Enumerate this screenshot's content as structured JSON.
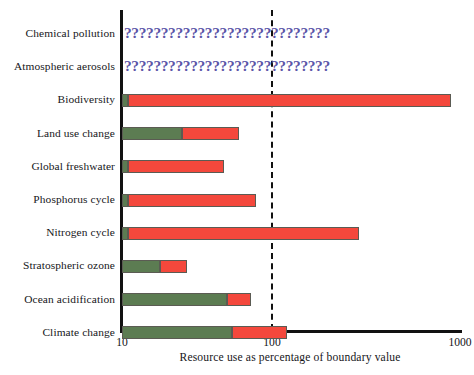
{
  "chart_data": {
    "type": "bar",
    "orientation": "horizontal",
    "title": "",
    "xlabel": "Resource use as percentage of boundary value",
    "ylabel": "",
    "xscale": "log",
    "xlim": [
      10,
      1000
    ],
    "xticks": [
      10,
      100,
      1000
    ],
    "xticklabels": [
      "10",
      "100",
      "1000"
    ],
    "grid": false,
    "legend": false,
    "boundary_line": {
      "value": 100,
      "style": "dashed",
      "color": "#111111",
      "label": ""
    },
    "categories": [
      "Chemical pollution",
      "Atmospheric aerosols",
      "Biodiversity",
      "Land use change",
      "Global freshwater",
      "Phosphorus cycle",
      "Nitrogen cycle",
      "Stratospheric ozone",
      "Ocean acidification",
      "Climate change"
    ],
    "series": [
      {
        "name": "Within boundary (green)",
        "color": "#5c7c52",
        "values": [
          null,
          null,
          11,
          25,
          11,
          11,
          11,
          18,
          50,
          54
        ]
      },
      {
        "name": "Total resource use (red end)",
        "color": "#f4483c",
        "values": [
          null,
          null,
          900,
          60,
          48,
          78,
          290,
          27,
          73,
          120
        ]
      }
    ],
    "unknown_marker": "????????????????????????????",
    "unknown_categories": [
      "Chemical pollution",
      "Atmospheric aerosols"
    ],
    "unknown_color": "#5b55a8"
  },
  "colors": {
    "green": "#5c7c52",
    "red": "#f4483c",
    "axis": "#111111",
    "unknown": "#5b55a8",
    "background": "#ffffff"
  }
}
